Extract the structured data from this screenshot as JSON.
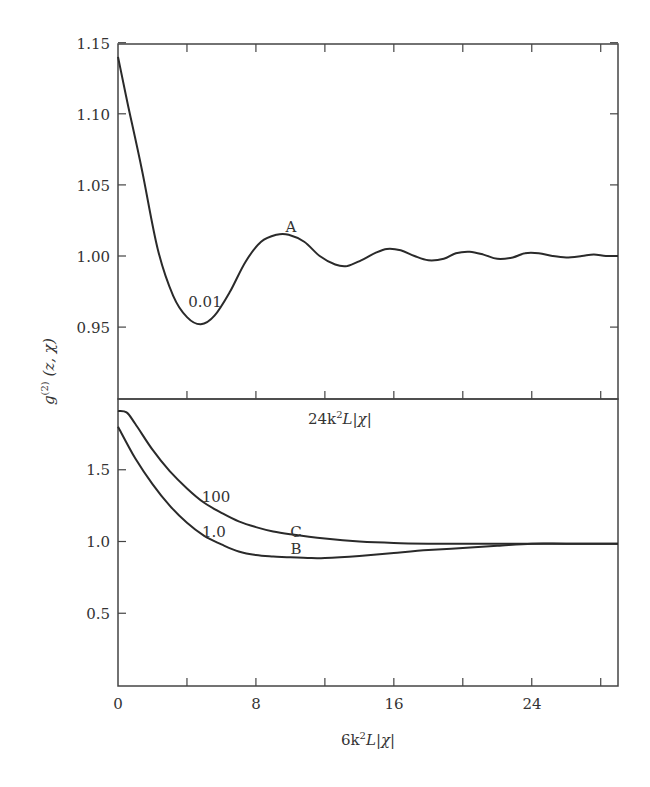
{
  "chart_data": [
    {
      "type": "line",
      "panel": "top",
      "title": "",
      "xlabel": "",
      "ylabel": "g(2)(z, χ)",
      "xlim": [
        0,
        29
      ],
      "ylim": [
        0.9,
        1.15
      ],
      "yticks": [
        "1.15",
        "1.10",
        "1.05",
        "1.00",
        "0.95"
      ],
      "grid": false,
      "series": [
        {
          "name": "A",
          "parameter_label": "0.01",
          "x": [
            0,
            0.6,
            1.4,
            2.3,
            3.2,
            4.0,
            4.8,
            5.6,
            6.5,
            7.4,
            8.3,
            9.2,
            9.9,
            10.8,
            11.7,
            12.6,
            13.3,
            14.1,
            14.9,
            15.6,
            16.4,
            17.2,
            18.0,
            18.9,
            19.6,
            20.4,
            21.2,
            22.0,
            22.9,
            23.6,
            24.4,
            25.2,
            26.0,
            26.9,
            27.6,
            28.3,
            29.0
          ],
          "values": [
            1.14,
            1.105,
            1.06,
            1.005,
            0.972,
            0.957,
            0.952,
            0.958,
            0.975,
            0.996,
            1.01,
            1.015,
            1.015,
            1.01,
            1.0,
            0.994,
            0.993,
            0.997,
            1.002,
            1.005,
            1.004,
            1.0,
            0.997,
            0.998,
            1.002,
            1.003,
            1.001,
            0.998,
            0.999,
            1.002,
            1.002,
            1.0,
            0.999,
            1.0,
            1.001,
            1.0,
            1.0
          ]
        }
      ],
      "annotations": [
        "A",
        "0.01"
      ]
    },
    {
      "type": "line",
      "panel": "bottom",
      "title": "",
      "xlabel": "6k²L|χ|",
      "top_axis_label": "24k²L|χ|",
      "ylabel": "g(2)(z, χ)",
      "xlim": [
        0,
        29
      ],
      "ylim": [
        0,
        2.0
      ],
      "xticks": [
        "0",
        "8",
        "16",
        "24"
      ],
      "yticks": [
        "1.5",
        "1.0",
        "0.5"
      ],
      "grid": false,
      "series": [
        {
          "name": "C",
          "parameter_label": "100",
          "x": [
            0,
            0.5,
            1,
            2,
            3,
            4,
            5,
            6,
            7,
            8,
            9,
            10,
            12,
            14,
            16,
            18,
            20,
            22,
            24,
            26,
            29
          ],
          "values": [
            1.91,
            1.9,
            1.82,
            1.64,
            1.49,
            1.37,
            1.27,
            1.2,
            1.14,
            1.1,
            1.07,
            1.05,
            1.02,
            1.0,
            0.99,
            0.985,
            0.985,
            0.985,
            0.985,
            0.985,
            0.985
          ]
        },
        {
          "name": "B",
          "parameter_label": "1.0",
          "x": [
            0,
            1,
            2,
            3,
            4,
            5,
            6,
            7,
            8,
            9,
            10,
            11,
            12,
            14,
            16,
            18,
            20,
            22,
            24,
            26,
            29
          ],
          "values": [
            1.8,
            1.58,
            1.4,
            1.25,
            1.13,
            1.04,
            0.98,
            0.93,
            0.905,
            0.895,
            0.89,
            0.885,
            0.885,
            0.9,
            0.92,
            0.94,
            0.955,
            0.97,
            0.985,
            0.985,
            0.985
          ]
        }
      ],
      "annotations": [
        "C",
        "B",
        "100",
        "1.0"
      ]
    }
  ],
  "labels": {
    "ylabel_main": "g",
    "ylabel_sup": "(2)",
    "ylabel_args": " (z, χ)",
    "xlabel_prefix": "6k",
    "xlabel_sup": "2",
    "xlabel_suffix": "L|χ|",
    "top_axis_prefix": "24k",
    "top_axis_sup": "2",
    "top_axis_suffix": "L|χ|",
    "curve_A": "A",
    "curve_A_param": "0.01",
    "curve_B": "B",
    "curve_B_param": "1.0",
    "curve_C": "C",
    "curve_C_param": "100"
  },
  "ticks": {
    "top_y": [
      "1.15",
      "1.10",
      "1.05",
      "1.00",
      "0.95"
    ],
    "bottom_y": [
      "1.5",
      "1.0",
      "0.5"
    ],
    "x": [
      "0",
      "8",
      "16",
      "24"
    ]
  },
  "colors": {
    "line": "#2a2a2a",
    "axis": "#444444",
    "background": "#ffffff"
  }
}
